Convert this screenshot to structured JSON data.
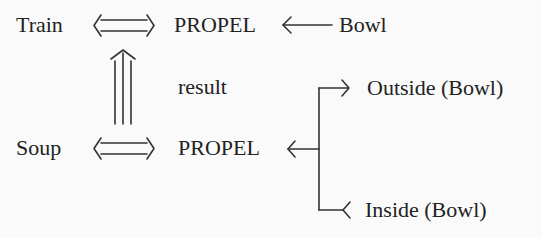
{
  "diagram": {
    "nodes": {
      "train": "Train",
      "propel_top": "PROPEL",
      "bowl": "Bowl",
      "result": "result",
      "soup": "Soup",
      "propel_bottom": "PROPEL",
      "outside_bowl": "Outside (Bowl)",
      "inside_bowl": "Inside (Bowl)"
    },
    "edges": [
      {
        "from": "Train",
        "to": "PROPEL",
        "type": "double-headed double arrow"
      },
      {
        "from": "Bowl",
        "to": "PROPEL",
        "type": "single arrow"
      },
      {
        "from": "Soup",
        "to": "PROPEL",
        "type": "double-headed double arrow"
      },
      {
        "from": "Soup-PROPEL",
        "to": "Train-PROPEL",
        "type": "triple arrow",
        "label": "result"
      },
      {
        "from": "bracket",
        "to": "PROPEL",
        "type": "single arrow"
      },
      {
        "from": "bracket",
        "to": "Outside (Bowl)",
        "type": "single arrow"
      },
      {
        "from": "Inside (Bowl)",
        "to": "bracket",
        "type": "arrow tail"
      }
    ],
    "colors": {
      "ink": "#222222",
      "background": "#fafafa"
    }
  }
}
